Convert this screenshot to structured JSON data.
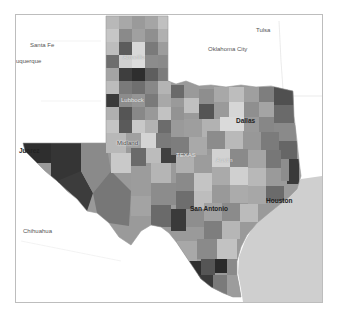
{
  "map": {
    "type": "choropleth",
    "region": "Texas counties",
    "colors": {
      "background": "#ffffff",
      "gulf": "#cfcfcf",
      "frame_border": "#bdbdbd",
      "darkest": "#2e2e2e",
      "dark": "#5a5a5a",
      "mid": "#8c8c8c",
      "light": "#b5b5b5",
      "lightest": "#dadada"
    },
    "labels": {
      "santa_fe": "Santa Fe",
      "albuquerque": "uquerque",
      "oklahoma_city": "Oklahoma City",
      "tulsa": "Tulsa",
      "amarillo": "Amarillo",
      "lubbock": "Lubbock",
      "dallas": "Dallas",
      "midland": "Midland",
      "texas": "TEXAS",
      "juarez": "Juarez",
      "austin": "Austin",
      "san_antonio": "San Antonio",
      "houston": "Houston",
      "chihuahua": "Chihuahua"
    }
  }
}
